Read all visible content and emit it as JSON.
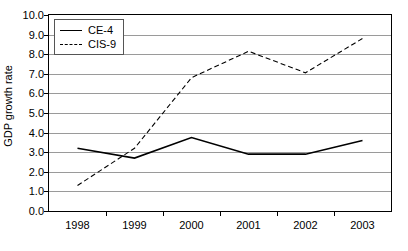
{
  "chart_data": {
    "type": "line",
    "title": "",
    "xlabel": "",
    "ylabel": "GDP growth rate",
    "categories": [
      "1998",
      "1999",
      "2000",
      "2001",
      "2002",
      "2003"
    ],
    "series": [
      {
        "name": "CE-4",
        "style": "solid",
        "color": "#000000",
        "values": [
          3.2,
          2.7,
          3.75,
          2.9,
          2.9,
          3.6
        ]
      },
      {
        "name": "CIS-9",
        "style": "dashed",
        "color": "#000000",
        "values": [
          1.3,
          3.2,
          6.8,
          8.15,
          7.05,
          8.8
        ]
      }
    ],
    "ylim": [
      0.0,
      10.0
    ],
    "ytick_step": 1.0,
    "y_ticks": [
      "0.0",
      "1.0",
      "2.0",
      "3.0",
      "4.0",
      "5.0",
      "6.0",
      "7.0",
      "8.0",
      "9.0",
      "10.0"
    ],
    "grid": "horizontal",
    "grid_color": "#9a9a9a",
    "legend_position": "top-left-inside",
    "plot_border_color": "#000000",
    "background_color": "#ffffff"
  }
}
